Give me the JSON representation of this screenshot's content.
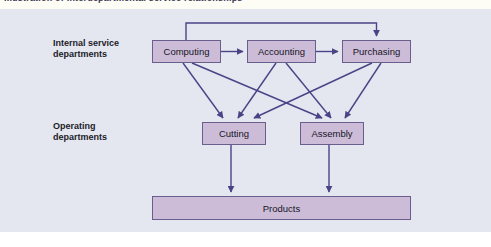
{
  "figure": {
    "top_strip_text": "Illustration of interdepartmental service relationships",
    "background_color": "#e4e6f0",
    "node_fill_color": "#cdbcd8",
    "node_border_color": "#6a5f8c",
    "arrow_color": "#4a4486"
  },
  "row_labels": [
    {
      "id": "internal",
      "line1": "Internal service",
      "line2": "departments"
    },
    {
      "id": "operating",
      "line1": "Operating",
      "line2": "departments"
    }
  ],
  "nodes": {
    "computing": "Computing",
    "accounting": "Accounting",
    "purchasing": "Purchasing",
    "cutting": "Cutting",
    "assembly": "Assembly",
    "products": "Products"
  },
  "diagram_data": {
    "type": "flow-diagram",
    "tiers": [
      {
        "name": "Internal service departments",
        "nodes": [
          "Computing",
          "Accounting",
          "Purchasing"
        ]
      },
      {
        "name": "Operating departments",
        "nodes": [
          "Cutting",
          "Assembly"
        ]
      },
      {
        "name": "Output",
        "nodes": [
          "Products"
        ]
      }
    ],
    "edges": [
      {
        "from": "Computing",
        "to": "Accounting",
        "style": "horizontal-arrow"
      },
      {
        "from": "Accounting",
        "to": "Purchasing",
        "style": "horizontal-arrow"
      },
      {
        "from": "Computing",
        "to": "Purchasing",
        "style": "top-feedback-arrow"
      },
      {
        "from": "Computing",
        "to": "Cutting",
        "style": "diagonal-arrow"
      },
      {
        "from": "Computing",
        "to": "Assembly",
        "style": "diagonal-arrow"
      },
      {
        "from": "Accounting",
        "to": "Cutting",
        "style": "diagonal-arrow"
      },
      {
        "from": "Accounting",
        "to": "Assembly",
        "style": "diagonal-arrow"
      },
      {
        "from": "Purchasing",
        "to": "Cutting",
        "style": "diagonal-arrow"
      },
      {
        "from": "Purchasing",
        "to": "Assembly",
        "style": "diagonal-arrow"
      },
      {
        "from": "Cutting",
        "to": "Products",
        "style": "vertical-arrow"
      },
      {
        "from": "Assembly",
        "to": "Products",
        "style": "vertical-arrow"
      }
    ]
  }
}
